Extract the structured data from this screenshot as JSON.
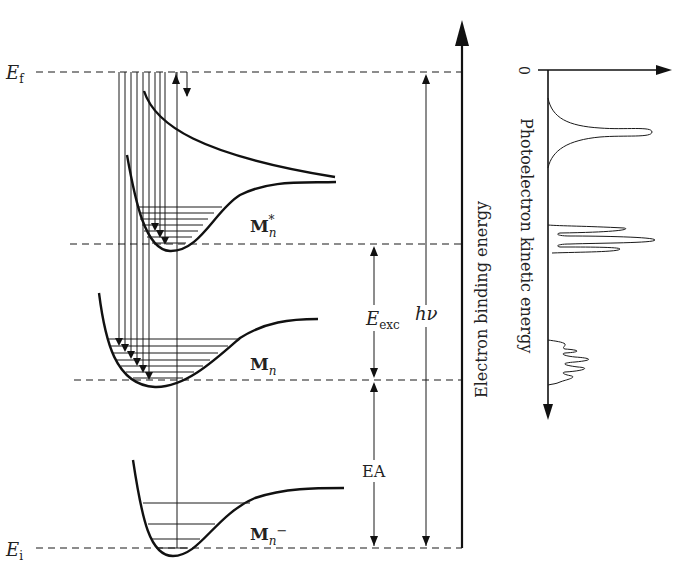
{
  "labels": {
    "e_final": "E",
    "e_final_sub": "f",
    "e_initial": "E",
    "e_initial_sub": "i",
    "m_excited": "M",
    "m_excited_sub": "n",
    "m_excited_sup": "*",
    "m_neutral": "M",
    "m_neutral_sub": "n",
    "m_anion": "M",
    "m_anion_sub": "n",
    "m_anion_sup": "−",
    "e_exc": "E",
    "e_exc_sub": "exc",
    "photon_energy": "hν",
    "ea": "EA",
    "binding_axis": "Electron binding energy",
    "kinetic_axis": "Photoelectron kinetic energy",
    "kinetic_zero": "0"
  },
  "levels": {
    "E_f_y": 72,
    "M_excited_y": 244,
    "M_neutral_y": 380,
    "E_i_y": 548
  },
  "colors": {
    "line": "#1a1a1a",
    "background": "#ffffff"
  }
}
